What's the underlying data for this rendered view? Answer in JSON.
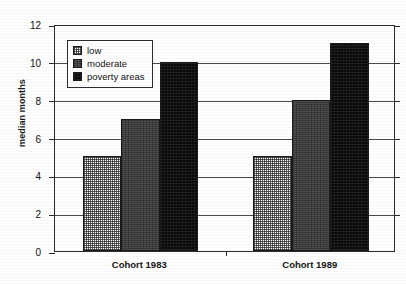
{
  "chart_data": {
    "type": "bar",
    "title": "",
    "xlabel": "",
    "ylabel": "median months",
    "categories": [
      "Cohort 1983",
      "Cohort 1989"
    ],
    "series": [
      {
        "name": "low",
        "values": [
          5,
          5
        ],
        "swatch": "#ffffff"
      },
      {
        "name": "moderate",
        "values": [
          7,
          8
        ],
        "swatch": "#3b3b3b"
      },
      {
        "name": "poverty areas",
        "values": [
          10,
          11
        ],
        "swatch": "#0a0a0a"
      }
    ],
    "ylim": [
      0,
      12
    ],
    "yticks": [
      0,
      2,
      4,
      6,
      8,
      10,
      12
    ],
    "ytick_labels": [
      "0",
      "2",
      "4",
      "6",
      "8",
      "10",
      "12"
    ],
    "grid": true,
    "legend_position": "upper left inside plot",
    "grouped": true
  },
  "axes": {
    "y_title": "median months",
    "y_ticks": [
      {
        "value": 12,
        "label": "12"
      },
      {
        "value": 10,
        "label": "10"
      },
      {
        "value": 8,
        "label": "8"
      },
      {
        "value": 6,
        "label": "6"
      },
      {
        "value": 4,
        "label": "4"
      },
      {
        "value": 2,
        "label": "2"
      },
      {
        "value": 0,
        "label": "0"
      }
    ],
    "x_categories": [
      {
        "label": "Cohort 1983"
      },
      {
        "label": "Cohort 1989"
      }
    ]
  },
  "legend": {
    "items": [
      {
        "label": "low"
      },
      {
        "label": "moderate"
      },
      {
        "label": "poverty areas"
      }
    ]
  }
}
